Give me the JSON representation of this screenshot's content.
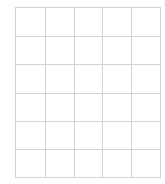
{
  "grid": {
    "columns": 5,
    "rows": 6,
    "line_color": "#d2d2d2",
    "background": "#ffffff",
    "cells": [
      [
        "",
        "",
        "",
        "",
        ""
      ],
      [
        "",
        "",
        "",
        "",
        ""
      ],
      [
        "",
        "",
        "",
        "",
        ""
      ],
      [
        "",
        "",
        "",
        "",
        ""
      ],
      [
        "",
        "",
        "",
        "",
        ""
      ],
      [
        "",
        "",
        "",
        "",
        ""
      ]
    ]
  }
}
